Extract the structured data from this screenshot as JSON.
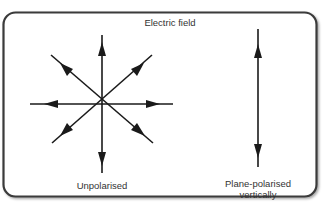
{
  "diagram": {
    "title": "Electric field",
    "left_label": "Unpolarised",
    "right_label_line1": "Plane-polarised",
    "right_label_line2": "vertically",
    "stroke_color": "#1a1a1a",
    "frame_color": "#3a3a3a"
  }
}
